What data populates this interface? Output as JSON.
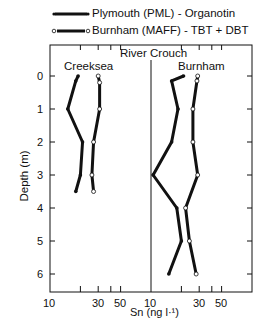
{
  "chart_data": {
    "type": "line",
    "title": "River Crouch",
    "xlabel": "Sn (ng l-1)",
    "ylabel": "Depth (m)",
    "x_scale": "log",
    "xlim": [
      10,
      100
    ],
    "ylim": [
      6.5,
      -0.5
    ],
    "y_ticks": [
      "0",
      "1",
      "2",
      "3",
      "4",
      "5",
      "6"
    ],
    "x_tick_labels": [
      "10",
      "30",
      "50"
    ],
    "legend": [
      {
        "name": "Plymouth (PML) - Organotin",
        "marker": "filled-circle"
      },
      {
        "name": "Burnham (MAFF) - TBT + DBT",
        "marker": "open-circle"
      }
    ],
    "panels": [
      {
        "name": "Creeksea",
        "series": [
          {
            "name": "Plymouth (PML) - Organotin",
            "points": [
              [
                19,
                0
              ],
              [
                18,
                0.15
              ],
              [
                15,
                1
              ],
              [
                21,
                2
              ],
              [
                20,
                3
              ],
              [
                18,
                3.5
              ]
            ]
          },
          {
            "name": "Burnham (MAFF) - TBT + DBT",
            "points": [
              [
                30,
                0
              ],
              [
                31,
                0.2
              ],
              [
                31,
                1
              ],
              [
                27,
                2
              ],
              [
                26,
                3
              ],
              [
                27,
                3.5
              ]
            ]
          }
        ]
      },
      {
        "name": "Burnham",
        "series": [
          {
            "name": "Plymouth (PML) - Organotin",
            "points": [
              [
                21,
                0
              ],
              [
                16,
                0.15
              ],
              [
                18.5,
                1
              ],
              [
                16,
                2
              ],
              [
                10.5,
                3
              ],
              [
                18,
                4
              ],
              [
                20,
                5
              ],
              [
                15,
                6
              ]
            ]
          },
          {
            "name": "Burnham (MAFF) - TBT + DBT",
            "points": [
              [
                29,
                0
              ],
              [
                28.5,
                0.15
              ],
              [
                26,
                1
              ],
              [
                26,
                2
              ],
              [
                29,
                3
              ],
              [
                22,
                4
              ],
              [
                24,
                5
              ],
              [
                28,
                6
              ]
            ]
          }
        ]
      }
    ]
  },
  "labels": {
    "legend_1": "Plymouth (PML) - Organotin",
    "legend_2": "Burnham (MAFF) - TBT + DBT",
    "title": "River Crouch",
    "panel_1": "Creeksea",
    "panel_2": "Burnham",
    "ylabel": "Depth (m)",
    "xlabel": "Sn (ng l·¹)",
    "x10": "10",
    "x30": "30",
    "x50": "50",
    "y0": "0",
    "y1": "1",
    "y2": "2",
    "y3": "3",
    "y4": "4",
    "y5": "5",
    "y6": "6"
  }
}
